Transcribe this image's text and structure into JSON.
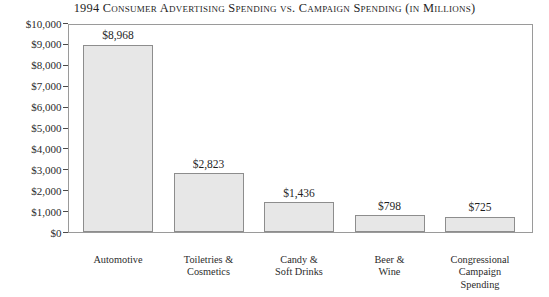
{
  "chart_data": {
    "type": "bar",
    "title": "1994 Consumer Advertising Spending vs. Campaign Spending (in Millions)",
    "xlabel": "",
    "ylabel": "",
    "ylim": [
      0,
      10000
    ],
    "grid": false,
    "legend": "none",
    "categories": [
      "Automotive",
      "Toiletries & Cosmetics",
      "Candy & Soft Drinks",
      "Beer & Wine",
      "Congressional Campaign Spending"
    ],
    "category_lines": [
      [
        "Automotive"
      ],
      [
        "Toiletries &",
        "Cosmetics"
      ],
      [
        "Candy &",
        "Soft Drinks"
      ],
      [
        "Beer &",
        "Wine"
      ],
      [
        "Congressional",
        "Campaign",
        "Spending"
      ]
    ],
    "values": [
      8968,
      2823,
      1436,
      798,
      725
    ],
    "value_labels": [
      "$8,968",
      "$2,823",
      "$1,436",
      "$798",
      "$725"
    ],
    "y_ticks": [
      0,
      1000,
      2000,
      3000,
      4000,
      5000,
      6000,
      7000,
      8000,
      9000,
      10000
    ],
    "y_tick_labels": [
      "$0",
      "$1,000",
      "$2,000",
      "$3,000",
      "$4,000",
      "$5,000",
      "$6,000",
      "$7,000",
      "$8,000",
      "$9,000",
      "$10,000"
    ],
    "colors": {
      "bar_fill": "#e7e7e7",
      "bar_border": "#8d8d8d",
      "frame": "#9a9a9a",
      "text": "#2b2b2b",
      "background": "#ffffff"
    }
  }
}
